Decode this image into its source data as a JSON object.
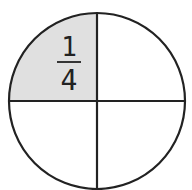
{
  "diagram": {
    "type": "fraction-circle",
    "parts": 4,
    "shaded_parts": 1,
    "shaded_quadrant": "top-left",
    "fraction": {
      "numerator": "1",
      "denominator": "4"
    },
    "colors": {
      "stroke": "#222222",
      "shaded_fill": "#e0e0e0",
      "unshaded_fill": "#ffffff"
    }
  }
}
